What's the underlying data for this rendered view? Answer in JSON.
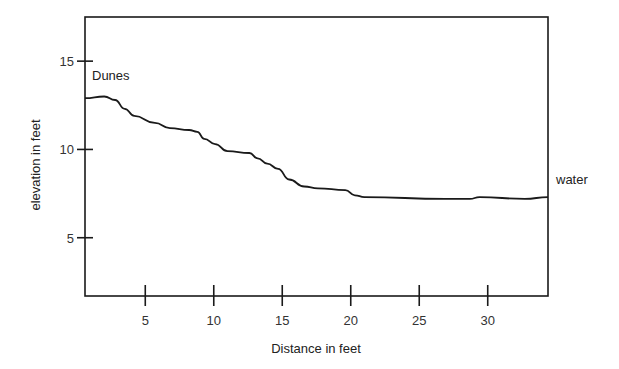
{
  "chart_data": {
    "type": "line",
    "title": "",
    "xlabel": "Distance in feet",
    "ylabel": "elevation in feet",
    "xlim": [
      0.6,
      34.4
    ],
    "ylim": [
      1.7,
      17.5
    ],
    "xticks": [
      5,
      10,
      15,
      20,
      25,
      30
    ],
    "yticks": [
      5,
      10,
      15
    ],
    "grid": false,
    "legend": null,
    "annotations": [
      {
        "text": "Dunes",
        "x": 1.0,
        "y": 14.3
      },
      {
        "text": "water",
        "x": 35.0,
        "y": 8.0
      }
    ],
    "series": [
      {
        "name": "beach profile",
        "x": [
          0.6,
          2.0,
          2.8,
          3.5,
          4.2,
          5.7,
          6.8,
          8.2,
          8.8,
          9.3,
          10.1,
          11.0,
          12.6,
          13.2,
          13.9,
          14.7,
          15.5,
          16.6,
          17.6,
          19.6,
          20.3,
          21.0,
          26.9,
          28.7,
          29.4,
          32.7,
          34.4
        ],
        "y": [
          12.9,
          13.0,
          12.8,
          12.3,
          11.9,
          11.5,
          11.2,
          11.1,
          11.0,
          10.6,
          10.3,
          9.9,
          9.8,
          9.5,
          9.2,
          8.9,
          8.3,
          7.9,
          7.8,
          7.7,
          7.4,
          7.3,
          7.2,
          7.2,
          7.3,
          7.2,
          7.3
        ]
      }
    ]
  },
  "colors": {
    "line": "#1a1a1a",
    "frame": "#1a1a1a",
    "background": "#ffffff"
  }
}
